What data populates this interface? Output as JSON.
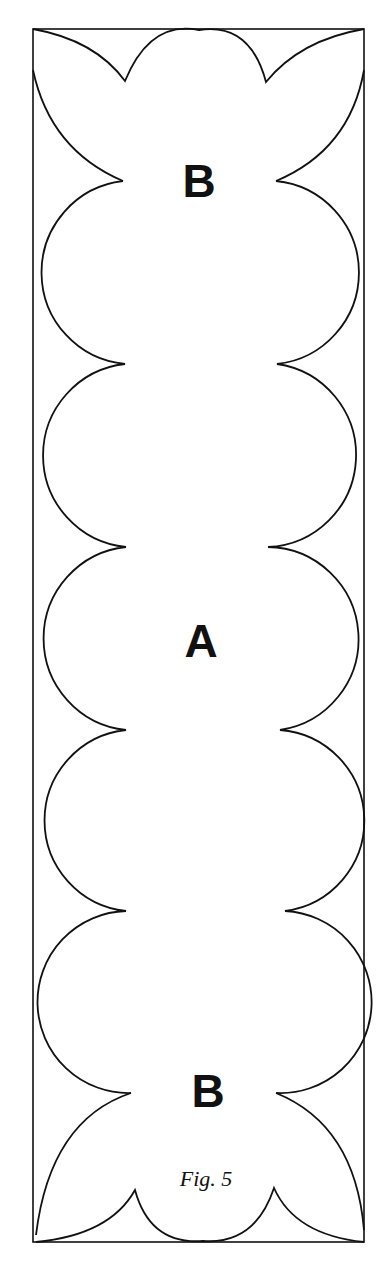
{
  "figure": {
    "caption": "Fig. 5",
    "labels": {
      "top": "B",
      "middle": "A",
      "bottom": "B"
    },
    "stroke_color": "#111111",
    "background": "#ffffff"
  }
}
